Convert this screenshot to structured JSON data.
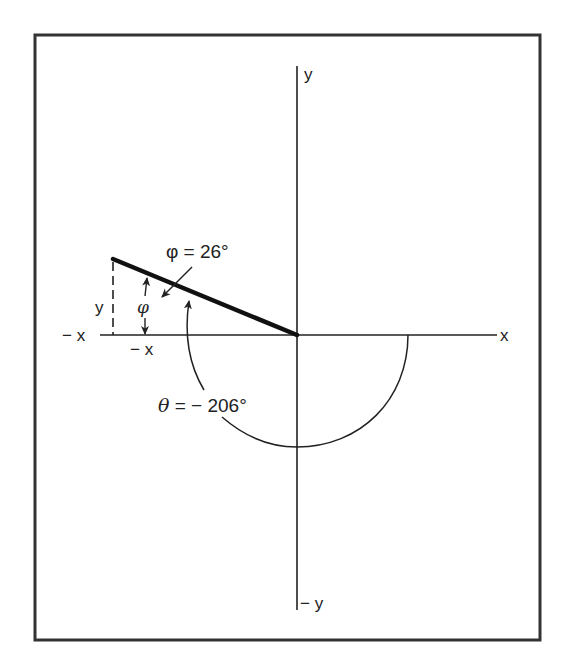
{
  "figure": {
    "labels": {
      "y_pos": "y",
      "y_neg": "− y",
      "x_pos": "x",
      "x_neg": "− x",
      "x_component": "− x",
      "y_component": "y",
      "phi_symbol": "φ",
      "phi_value": "φ = 26°",
      "theta_value_symbol": "θ",
      "theta_value_rest": " = − 206°"
    },
    "angles": {
      "phi_deg": 26,
      "theta_deg": -206
    },
    "colors": {
      "ink": "#222222",
      "frame": "#333333",
      "background": "#ffffff"
    }
  }
}
